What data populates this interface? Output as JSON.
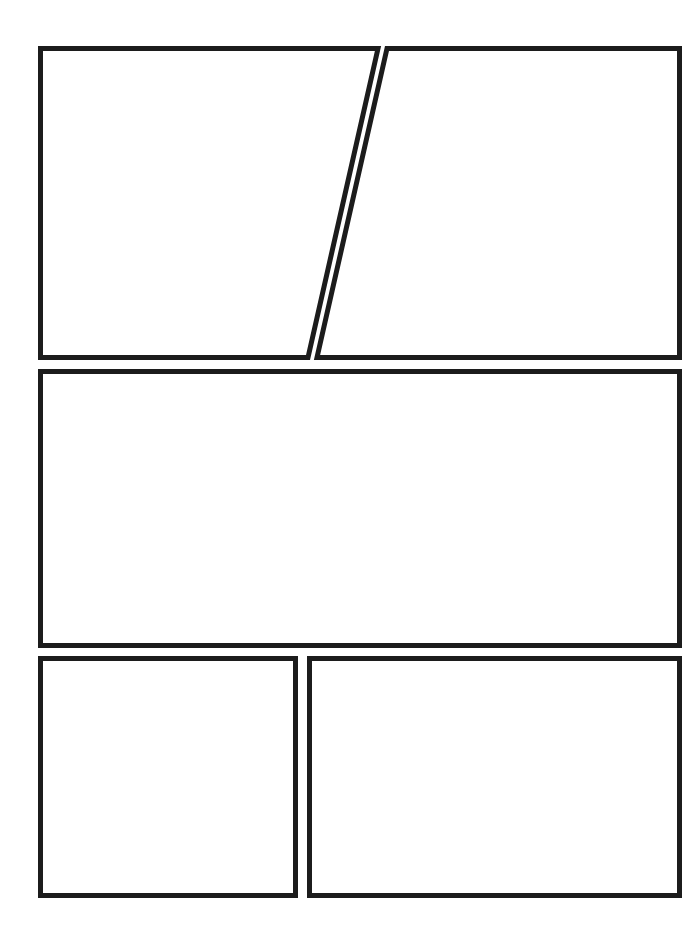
{
  "page": {
    "width": 698,
    "height": 933,
    "background_color": "#ffffff",
    "border_color": "#1c1c1c",
    "border_width": 5,
    "panel_fill": "#ffffff",
    "gutter_color": "#ffffff"
  },
  "layout": {
    "type": "comic-page-grid",
    "rows": 3,
    "panel_count": 5,
    "margins": {
      "left": 38,
      "right": 16,
      "top": 46,
      "bottom": 35
    }
  },
  "panels": [
    {
      "id": "panel-1",
      "name": "top-left-panel",
      "row": 1,
      "index": 1,
      "shape": "quadrilateral",
      "description": "Top-left panel with slanted right edge",
      "points": "40.5,48.5 378,48.5 308,357.5 40.5,357.5"
    },
    {
      "id": "panel-2",
      "name": "top-right-panel",
      "row": 1,
      "index": 2,
      "shape": "quadrilateral",
      "description": "Top-right panel with slanted left edge",
      "points": "387,48.5 679.5,48.5 679.5,357.5 317,357.5"
    },
    {
      "id": "panel-3",
      "name": "middle-wide-panel",
      "row": 2,
      "index": 1,
      "shape": "rectangle",
      "description": "Full-width middle panel",
      "points": "40.5,371.5 679.5,371.5 679.5,645.5 40.5,645.5"
    },
    {
      "id": "panel-4",
      "name": "bottom-left-panel",
      "row": 3,
      "index": 1,
      "shape": "rectangle",
      "description": "Bottom-left square panel",
      "points": "40.5,658.5 295.5,658.5 295.5,895.5 40.5,895.5"
    },
    {
      "id": "panel-5",
      "name": "bottom-right-panel",
      "row": 3,
      "index": 2,
      "shape": "rectangle",
      "description": "Bottom-right wide panel",
      "points": "309.5,658.5 679.5,658.5 679.5,895.5 309.5,895.5"
    }
  ]
}
